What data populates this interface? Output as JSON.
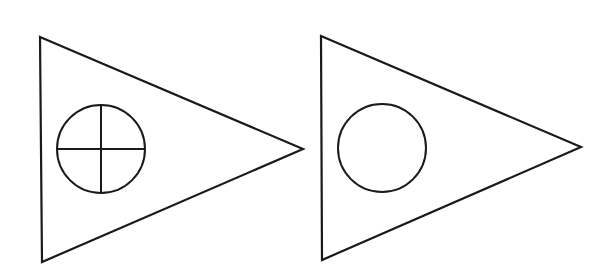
{
  "figures": [
    {
      "id": "left",
      "shape": "triangle-pointing-right",
      "vertices": [
        [
          40,
          37
        ],
        [
          303,
          149
        ],
        [
          42,
          262
        ]
      ],
      "inner": {
        "shape": "circle-with-cross",
        "cx": 101,
        "cy": 149,
        "r": 44
      }
    },
    {
      "id": "right",
      "shape": "triangle-pointing-right",
      "vertices": [
        [
          321,
          36
        ],
        [
          581,
          147
        ],
        [
          322,
          260
        ]
      ],
      "inner": {
        "shape": "circle",
        "cx": 382,
        "cy": 148,
        "r": 44
      }
    }
  ],
  "stroke_color": "#1a1a1a",
  "background_color": "#ffffff"
}
